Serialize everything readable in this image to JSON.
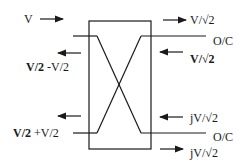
{
  "diagram": {
    "type": "hybrid-coupler",
    "colors": {
      "stroke": "#1a1a1a",
      "background": "#ffffff"
    },
    "left": {
      "input_label": "V",
      "top_reflect_bold": "V/2",
      "top_reflect_rest": " -V/2",
      "bottom_reflect_bold": "V/2",
      "bottom_reflect_rest": " +V/2"
    },
    "right": {
      "top_out": "V/√2",
      "top_port": "O/C",
      "top_back": "V/√2",
      "bottom_back": "jV/√2",
      "bottom_port": "O/C",
      "bottom_out": "jV/√2"
    }
  }
}
